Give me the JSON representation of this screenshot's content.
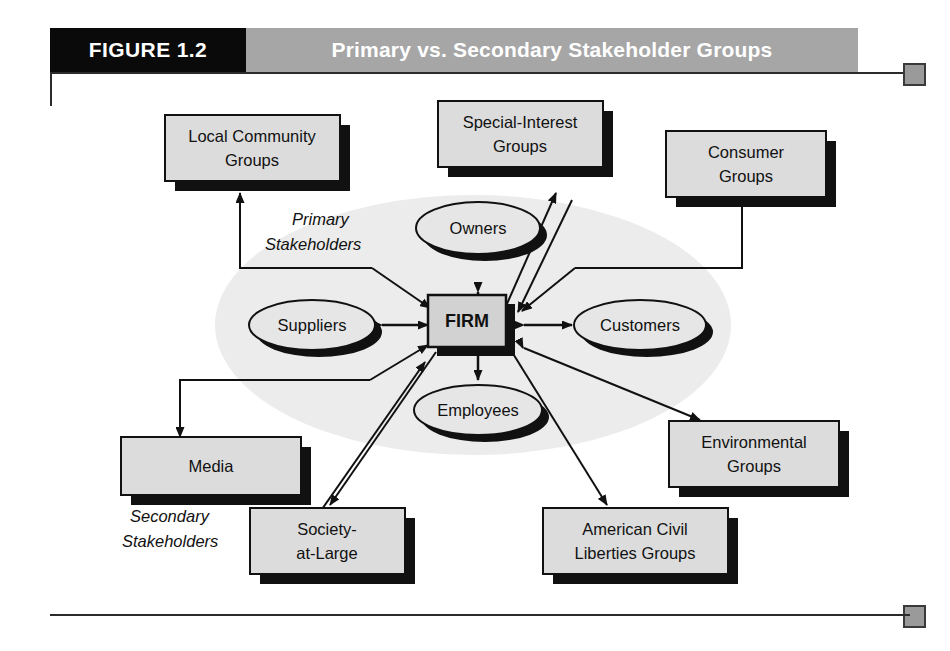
{
  "figure": {
    "number_label": "FIGURE 1.2",
    "title": "Primary vs. Secondary Stakeholder Groups"
  },
  "colors": {
    "header_number_bg": "#0a0a0a",
    "header_title_bg": "#a6a6a6",
    "header_text": "#ffffff",
    "box_fill": "#dcdcdc",
    "oval_fill": "#e6e6e6",
    "firm_fill": "#d2d2d2",
    "shadow": "#111111",
    "halo_fill": "#ececec",
    "stroke": "#111111",
    "corner_marker": "#9a9a9a"
  },
  "center": {
    "label": "FIRM"
  },
  "group_labels": {
    "primary_line1": "Primary",
    "primary_line2": "Stakeholders",
    "secondary_line1": "Secondary",
    "secondary_line2": "Stakeholders"
  },
  "primary_stakeholders": [
    {
      "id": "owners",
      "label": "Owners"
    },
    {
      "id": "suppliers",
      "label": "Suppliers"
    },
    {
      "id": "customers",
      "label": "Customers"
    },
    {
      "id": "employees",
      "label": "Employees"
    }
  ],
  "secondary_stakeholders": [
    {
      "id": "local-community-groups",
      "line1": "Local Community",
      "line2": "Groups"
    },
    {
      "id": "special-interest-groups",
      "line1": "Special-Interest",
      "line2": "Groups"
    },
    {
      "id": "consumer-groups",
      "line1": "Consumer",
      "line2": "Groups"
    },
    {
      "id": "media",
      "line1": "Media",
      "line2": ""
    },
    {
      "id": "environmental-groups",
      "line1": "Environmental",
      "line2": "Groups"
    },
    {
      "id": "society-at-large",
      "line1": "Society-",
      "line2": "at-Large"
    },
    {
      "id": "american-civil-liberties-groups",
      "line1": "American Civil",
      "line2": "Liberties Groups"
    }
  ]
}
